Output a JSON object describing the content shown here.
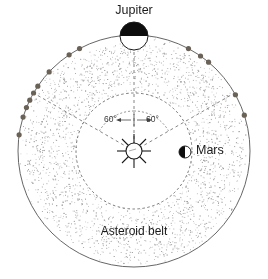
{
  "figure": {
    "background_color": "#ffffff",
    "ink_color": "#1a1a1a",
    "stipple_color": "#9a9a9a",
    "trojan_color": "#6b6257",
    "orbit_line_color": "#555555"
  },
  "labels": {
    "jupiter": "Jupiter",
    "mars": "Mars",
    "asteroid_belt": "Asteroid belt",
    "angle_left": "60°",
    "angle_right": "60°"
  },
  "chart_data": {
    "type": "scatter",
    "center": {
      "x": 134,
      "y": 151,
      "name": "Sun"
    },
    "orbits": [
      {
        "name": "jupiter-orbit",
        "radius": 116,
        "style": "solid",
        "color": "#555555"
      },
      {
        "name": "mars-orbit",
        "radius": 58,
        "style": "dashed",
        "color": "#555555"
      }
    ],
    "bodies": [
      {
        "name": "Sun",
        "x": 134,
        "y": 151,
        "radius": 8,
        "symbol": "rayed-circle",
        "fill": "#ffffff"
      },
      {
        "name": "Jupiter",
        "x": 134,
        "y": 36,
        "radius": 14,
        "symbol": "half-shaded-circle-top",
        "angle_deg": 90
      },
      {
        "name": "Mars",
        "x": 185,
        "y": 152,
        "radius": 6,
        "symbol": "half-shaded-circle-left",
        "angle_deg": 0
      }
    ],
    "angle_markers": [
      {
        "label": "60°",
        "from": "Sun-Jupiter line",
        "direction": "counterclockwise",
        "value": 60
      },
      {
        "label": "60°",
        "from": "Sun-Jupiter line",
        "direction": "clockwise",
        "value": 60
      }
    ],
    "radial_lines": [
      {
        "name": "sun-to-jupiter",
        "angle_deg": 90,
        "style": "dashed"
      },
      {
        "name": "sun-to-L4",
        "angle_deg": 150,
        "style": "dashed"
      },
      {
        "name": "sun-to-L5",
        "angle_deg": 30,
        "style": "dashed"
      }
    ],
    "trojan_groups": [
      {
        "name": "L4-leading-cluster",
        "side": "left",
        "count": 9,
        "points_deg": [
          118,
          124,
          137,
          146,
          150,
          154,
          158,
          163,
          172
        ]
      },
      {
        "name": "L5-trailing-cluster",
        "side": "right",
        "count": 5,
        "points_deg": [
          62,
          55,
          50,
          29,
          18
        ]
      }
    ],
    "belt": {
      "name": "asteroid-belt",
      "inner_radius": 58,
      "outer_radius": 116,
      "render": "stipple",
      "density": "medium"
    },
    "xlabel": "",
    "ylabel": "",
    "grid": false,
    "legend": "none"
  }
}
